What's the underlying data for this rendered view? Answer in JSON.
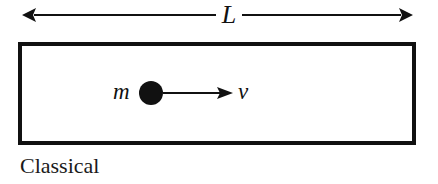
{
  "diagram": {
    "length_label": "L",
    "mass_label": "m",
    "velocity_label": "v",
    "caption": "Classical",
    "colors": {
      "ink": "#111111",
      "background": "#ffffff"
    },
    "elements": {
      "dimension_arrow": {
        "x1": 22,
        "x2": 413,
        "y": 15,
        "double_headed": true
      },
      "box": {
        "x": 20,
        "y": 44,
        "width": 394,
        "height": 99,
        "stroke_width": 4
      },
      "particle": {
        "cx": 151,
        "cy": 93,
        "r": 12
      },
      "velocity_arrow": {
        "x1": 163,
        "x2": 232,
        "y": 93
      }
    }
  }
}
